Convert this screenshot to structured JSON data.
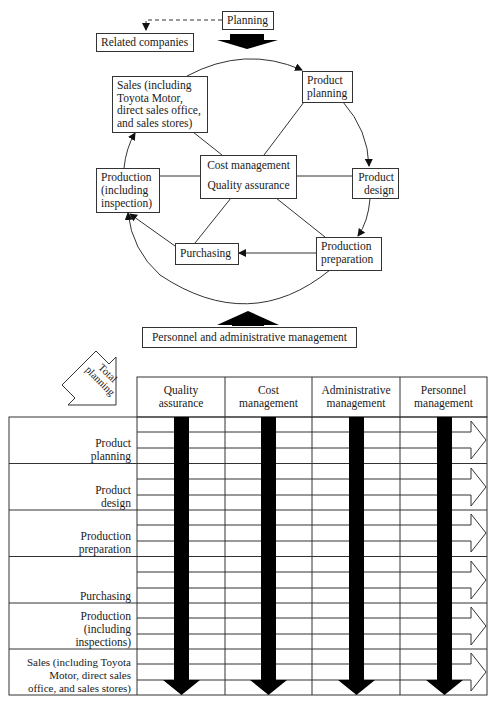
{
  "top_diagram": {
    "planning": "Planning",
    "related_companies": "Related companies",
    "sales": "Sales (including Toyota Motor, direct sales office, and sales stores)",
    "sales_lines": [
      "Sales (including",
      "Toyota Motor,",
      "direct sales office,",
      "and sales stores)"
    ],
    "product_planning_lines": [
      "Product",
      "planning"
    ],
    "product_design_lines": [
      "Product",
      "design"
    ],
    "production_preparation_lines": [
      "Production",
      "preparation"
    ],
    "purchasing": "Purchasing",
    "production_lines": [
      "Production",
      "(including",
      "inspection)"
    ],
    "center_top": "Cost management",
    "center_bottom": "Quality assurance",
    "personnel": "Personnel and administrative management"
  },
  "matrix": {
    "corner_label_lines": [
      "Total",
      "planning"
    ],
    "columns": [
      {
        "lines": [
          "Quality",
          "assurance"
        ]
      },
      {
        "lines": [
          "Cost",
          "management"
        ]
      },
      {
        "lines": [
          "Administrative",
          "management"
        ]
      },
      {
        "lines": [
          "Personnel",
          "management"
        ]
      }
    ],
    "rows": [
      {
        "lines": [
          "Product",
          "planning"
        ]
      },
      {
        "lines": [
          "Product",
          "design"
        ]
      },
      {
        "lines": [
          "Production",
          "preparation"
        ]
      },
      {
        "lines": [
          "Purchasing"
        ]
      },
      {
        "lines": [
          "Production",
          "(including",
          "inspections)"
        ]
      },
      {
        "lines": [
          "Sales (including Toyota",
          "Motor, direct sales",
          "office, and sales stores)"
        ]
      }
    ]
  },
  "colors": {
    "line": "#333333",
    "arrow_fill": "#000000",
    "background": "#ffffff"
  }
}
